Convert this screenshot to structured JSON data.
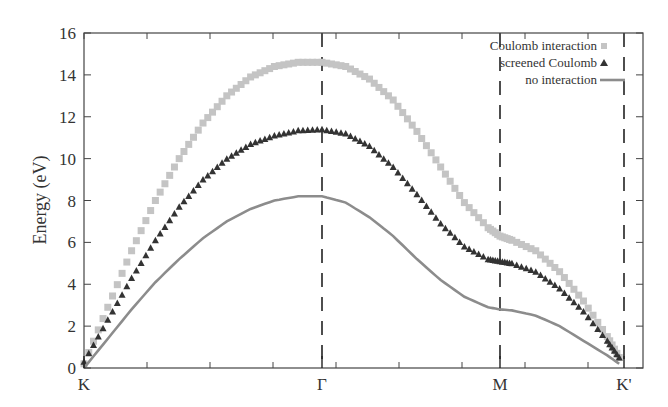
{
  "chart_data": {
    "type": "line",
    "title": "",
    "xlabel": "",
    "ylabel": "Energy (eV)",
    "ylim": [
      0,
      16
    ],
    "yticks": [
      0,
      2,
      4,
      6,
      8,
      10,
      12,
      14,
      16
    ],
    "xticks": [
      {
        "label": "K",
        "pos": 0.0
      },
      {
        "label": "Γ",
        "pos": 1.0
      },
      {
        "label": "M",
        "pos": 1.75
      },
      {
        "label": "K'",
        "pos": 2.27
      }
    ],
    "xlim": [
      0,
      2.35
    ],
    "vertical_dashed_lines_at": [
      1.0,
      1.75,
      2.27
    ],
    "grid": false,
    "legend": {
      "position": "top-right",
      "entries": [
        "Coulomb interaction",
        "screened Coulomb",
        "no interaction"
      ]
    },
    "series": [
      {
        "name": "Coulomb interaction",
        "marker": "square",
        "color": "#c4c4c4",
        "x": [
          0.0,
          0.1,
          0.2,
          0.3,
          0.4,
          0.5,
          0.6,
          0.7,
          0.8,
          0.9,
          1.0,
          1.1,
          1.2,
          1.3,
          1.4,
          1.5,
          1.6,
          1.7,
          1.75,
          1.8,
          1.9,
          2.0,
          2.1,
          2.2,
          2.25
        ],
        "values": [
          0.2,
          2.9,
          5.6,
          8.0,
          10.0,
          11.7,
          13.0,
          13.9,
          14.4,
          14.6,
          14.6,
          14.4,
          13.8,
          12.8,
          11.3,
          9.6,
          7.9,
          6.7,
          6.3,
          6.1,
          5.6,
          4.6,
          3.2,
          1.5,
          0.5
        ]
      },
      {
        "name": "screened Coulomb",
        "marker": "triangle",
        "color": "#333333",
        "x": [
          0.0,
          0.1,
          0.2,
          0.3,
          0.4,
          0.5,
          0.6,
          0.7,
          0.8,
          0.9,
          1.0,
          1.1,
          1.2,
          1.3,
          1.4,
          1.5,
          1.6,
          1.7,
          1.75,
          1.8,
          1.9,
          2.0,
          2.1,
          2.2,
          2.25
        ],
        "values": [
          0.3,
          2.3,
          4.3,
          6.1,
          7.7,
          9.0,
          10.0,
          10.7,
          11.1,
          11.35,
          11.4,
          11.2,
          10.6,
          9.6,
          8.3,
          6.9,
          5.8,
          5.2,
          5.1,
          5.0,
          4.6,
          3.8,
          2.7,
          1.3,
          0.5
        ]
      },
      {
        "name": "no interaction",
        "marker": "line",
        "color": "#8c8c8c",
        "x": [
          0.0,
          0.1,
          0.2,
          0.3,
          0.4,
          0.5,
          0.6,
          0.7,
          0.8,
          0.9,
          1.0,
          1.1,
          1.2,
          1.3,
          1.4,
          1.5,
          1.6,
          1.7,
          1.75,
          1.8,
          1.9,
          2.0,
          2.1,
          2.2,
          2.25
        ],
        "values": [
          0.0,
          1.4,
          2.8,
          4.1,
          5.2,
          6.2,
          7.0,
          7.6,
          8.0,
          8.2,
          8.2,
          7.9,
          7.2,
          6.3,
          5.2,
          4.2,
          3.4,
          2.9,
          2.8,
          2.75,
          2.5,
          2.0,
          1.3,
          0.6,
          0.2
        ]
      }
    ]
  }
}
